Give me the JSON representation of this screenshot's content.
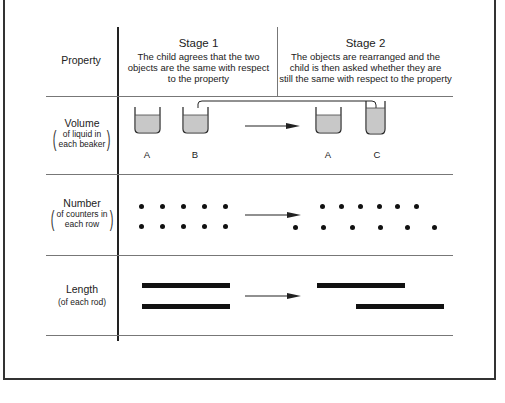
{
  "header": {
    "property_label": "Property",
    "stage1": {
      "title": "Stage 1",
      "description_lines": [
        "The child agrees that the two",
        "objects are the same with respect",
        "to the property"
      ]
    },
    "stage2": {
      "title": "Stage 2",
      "description_lines": [
        "The objects are rearranged and the",
        "child is then asked whether they are",
        "still the same with respect to the property"
      ]
    }
  },
  "rows": [
    {
      "property": "Volume",
      "qualifier_lines": [
        "of liquid in",
        "each beaker"
      ],
      "stage1": {
        "beakers": [
          "A",
          "B"
        ]
      },
      "stage2": {
        "beakers": [
          "A",
          "C"
        ]
      }
    },
    {
      "property": "Number",
      "qualifier_lines": [
        "of counters in",
        "each row"
      ],
      "stage1": {
        "top_row_count": 5,
        "bottom_row_count": 5
      },
      "stage2": {
        "top_row_count": 6,
        "bottom_row_count": 6
      }
    },
    {
      "property": "Length",
      "qualifier_lines": [
        "(of each rod)"
      ],
      "stage1": {
        "rods": 2
      },
      "stage2": {
        "rods": 2
      }
    }
  ],
  "colors": {
    "line": "#222222",
    "liquid": "#c8c8c8",
    "ink": "#111111"
  }
}
